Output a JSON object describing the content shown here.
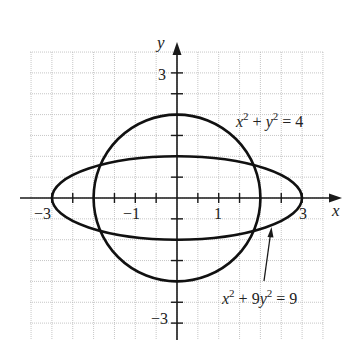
{
  "chart_data": {
    "type": "line",
    "title": "",
    "xlabel": "x",
    "ylabel": "y",
    "xlim": [
      -3.5,
      3.5
    ],
    "ylim": [
      -3.5,
      3.5
    ],
    "grid": true,
    "grid_step": 0.5,
    "x_ticks": [
      -3,
      -2.5,
      -2,
      -1.5,
      -1,
      -0.5,
      0.5,
      1,
      1.5,
      2,
      2.5,
      3
    ],
    "y_ticks": [
      -3,
      -2.5,
      -2,
      -1.5,
      -1,
      -0.5,
      0.5,
      1,
      1.5,
      2,
      2.5,
      3
    ],
    "x_tick_labels": [
      {
        "value": -3,
        "text": "−3"
      },
      {
        "value": -1,
        "text": "−1"
      },
      {
        "value": 1,
        "text": "1"
      },
      {
        "value": 3,
        "text": "3"
      }
    ],
    "y_tick_labels": [
      {
        "value": 3,
        "text": "3"
      },
      {
        "value": -3,
        "text": "−3"
      }
    ],
    "series": [
      {
        "name": "circle",
        "equation": "x² + y² = 4",
        "shape": "circle",
        "center": [
          0,
          0
        ],
        "radius": 2
      },
      {
        "name": "ellipse",
        "equation": "x² + 9y² = 9",
        "shape": "ellipse",
        "center": [
          0,
          0
        ],
        "semi_major_x": 3,
        "semi_minor_y": 1
      }
    ],
    "annotations": [
      {
        "text": "x² + y² = 4",
        "attached_to": "circle"
      },
      {
        "text": "x² + 9y² = 9",
        "attached_to": "ellipse",
        "arrow": true
      }
    ]
  },
  "labels": {
    "x_axis": "x",
    "y_axis": "y",
    "tick_x_neg3": "−3",
    "tick_x_neg1": "−1",
    "tick_x_1": "1",
    "tick_x_3": "3",
    "tick_y_3": "3",
    "tick_y_neg3": "−3",
    "circle_eq": {
      "a": "x",
      "b": "2",
      "c": " + ",
      "d": "y",
      "e": "2",
      "f": " = 4"
    },
    "ellipse_eq": {
      "a": "x",
      "b": "2",
      "c": " + 9",
      "d": "y",
      "e": "2",
      "f": " = 9"
    }
  }
}
